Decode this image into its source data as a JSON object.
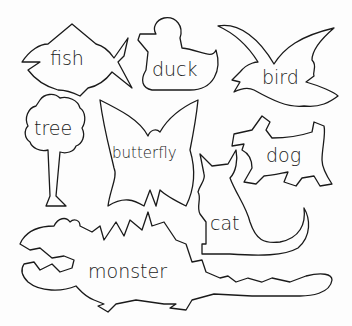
{
  "page": {
    "background": "#fdfdfd",
    "ink_color": "#1a1a1a"
  },
  "shapes": [
    {
      "id": "fish",
      "label": "fish"
    },
    {
      "id": "duck",
      "label": "duck"
    },
    {
      "id": "bird",
      "label": "bird"
    },
    {
      "id": "tree",
      "label": "tree"
    },
    {
      "id": "butterfly",
      "label": "butterfly"
    },
    {
      "id": "dog",
      "label": "dog"
    },
    {
      "id": "cat",
      "label": "cat"
    },
    {
      "id": "monster",
      "label": "monster"
    }
  ]
}
